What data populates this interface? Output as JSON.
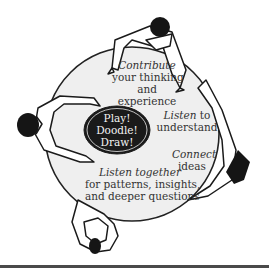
{
  "diagram": {
    "center_oval": {
      "lines": [
        "Play!",
        "Doodle!",
        "Draw!"
      ],
      "fill": "#1a1a1a",
      "text_color": "#f2f2f2"
    },
    "table": {
      "fill": "#efefef",
      "stroke": "#222222"
    },
    "labels": {
      "contribute": {
        "emphasis": "Contribute",
        "line2": "your thinking",
        "line3": "and",
        "line4": "experience"
      },
      "listen_understand": {
        "emphasis": "Listen",
        "rest": " to",
        "line2": "understand"
      },
      "connect": {
        "emphasis": "Connect",
        "line2": "ideas"
      },
      "listen_together": {
        "emphasis": "Listen together",
        "line2": "for patterns, insights,",
        "line3": "and deeper questions"
      }
    },
    "people": [
      {
        "position": "top",
        "label": "person-top"
      },
      {
        "position": "left",
        "label": "person-left"
      },
      {
        "position": "right",
        "label": "person-right"
      },
      {
        "position": "bottom",
        "label": "person-bottom"
      }
    ]
  }
}
